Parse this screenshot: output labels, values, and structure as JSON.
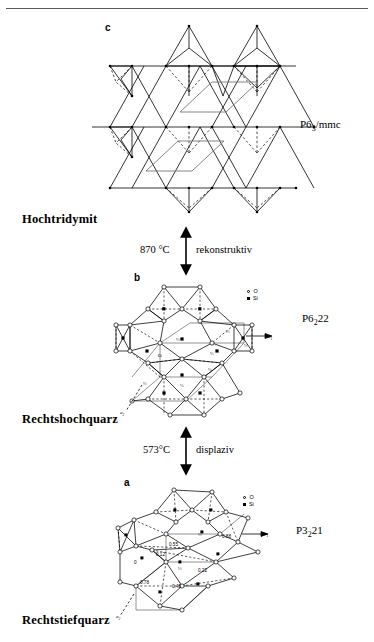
{
  "figure": {
    "title_rule": true,
    "panels": [
      {
        "id": "c",
        "letter": "c",
        "phase_name": "Hochtridymit",
        "space_group": "P6",
        "space_group_sub": "3",
        "space_group_rest": "/mmc",
        "structure_type": "tridymite-tetrahedral-net"
      },
      {
        "id": "b",
        "letter": "b",
        "phase_name": "Rechtshochquarz",
        "space_group": "P6",
        "space_group_sub": "2",
        "space_group_rest": "22",
        "structure_type": "high-quartz-net",
        "axis_label_a1": "a",
        "axis_label_a1_sub": "1",
        "axis_label_a2": "a",
        "axis_label_a2_sub": "2",
        "height_labels": [
          "⅓",
          "⅓",
          "⅓",
          "⅓",
          "⅓",
          "⅓",
          "0",
          "0",
          "⅓",
          "⅓"
        ]
      },
      {
        "id": "a",
        "letter": "a",
        "phase_name": "Rechtstiefquarz",
        "space_group": "P3",
        "space_group_sub": "2",
        "space_group_rest": "21",
        "structure_type": "low-quartz-net",
        "axis_label_a1": "a",
        "axis_label_a1_sub": "1",
        "axis_label_a2": "a",
        "axis_label_a2_sub": "2",
        "coordinate_labels": [
          "0.55",
          "0.12",
          "0.88",
          "0.22",
          "0.45",
          "0.78",
          "0"
        ],
        "height_labels": [
          "⅓",
          "⅓",
          "⅓"
        ]
      }
    ],
    "transitions": [
      {
        "id": "tridymite-quartz",
        "temperature": "870 °C",
        "mechanism": "rekonstruktiv",
        "arrow": "double-vertical"
      },
      {
        "id": "high-low-quartz",
        "temperature": "573°C",
        "mechanism": "displaziv",
        "arrow": "double-vertical"
      }
    ],
    "legend": {
      "oxygen_label": "O",
      "silicon_label": "Si"
    },
    "colors": {
      "line": "#000000",
      "rule": "#5a5a5a",
      "cell_outline": "#555555"
    }
  }
}
